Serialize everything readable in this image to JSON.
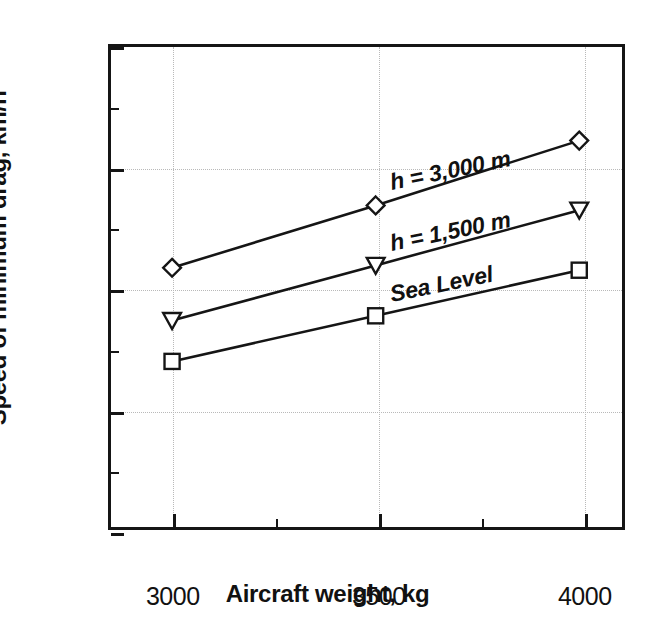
{
  "chart_data": {
    "type": "line",
    "title": "",
    "xlabel": "Aircraft weight, kg",
    "ylabel": "Speed of minimum drag, km/h",
    "x": [
      3000,
      3500,
      4000
    ],
    "xlim": [
      2850,
      4105
    ],
    "ylim": [
      150,
      250
    ],
    "xticks": [
      3000,
      3500,
      4000
    ],
    "xticklabels": [
      "3000",
      "3500",
      "4000"
    ],
    "xminorticks": [
      3250,
      3750
    ],
    "yticks": [
      150,
      175,
      200,
      225,
      250
    ],
    "yticklabels": [
      "150",
      "175",
      "200",
      "225",
      "250"
    ],
    "yminorticks": [
      162.5,
      187.5,
      212.5,
      237.5
    ],
    "grid": true,
    "grid_style": "dotted",
    "legend_position": "inline-annotations",
    "series": [
      {
        "name": "h = 3,000 m",
        "label": "h = 3,000 m",
        "marker": "diamond",
        "values": [
          204,
          217,
          230.5
        ],
        "label_angle_deg": -11.5
      },
      {
        "name": "h = 1,500 m",
        "label": "h = 1,500 m",
        "marker": "triangle-down",
        "values": [
          193,
          204.5,
          216
        ],
        "label_angle_deg": -11.5
      },
      {
        "name": "Sea Level",
        "label": "Sea Level",
        "marker": "square",
        "values": [
          184.5,
          194,
          203.5
        ],
        "label_angle_deg": -11.5
      }
    ],
    "colors": {
      "line": "#151515",
      "marker_fill": "#ffffff",
      "marker_edge": "#151515",
      "axis": "#151515",
      "grid": "#b9b9b9",
      "background": "#ffffff",
      "text": "#111111"
    }
  }
}
